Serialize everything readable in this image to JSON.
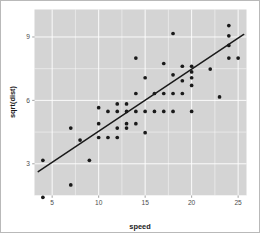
{
  "figure": {
    "background_color": "#ffffff",
    "border_color": "#b9b9b9",
    "panel_color": "#d4d4d4",
    "gridline_color": "#ffffff",
    "point_color": "#1a1a1a",
    "line_color": "#1a1a1a"
  },
  "chart_data": {
    "type": "scatter",
    "title": "",
    "subtitle": "",
    "xlabel": "speed",
    "ylabel": "sqrt(dist)",
    "xlim": [
      3.1,
      25.9
    ],
    "ylim": [
      1.5,
      10.3
    ],
    "xticks": [
      5,
      10,
      15,
      20,
      25
    ],
    "xtick_labels": [
      "5",
      "10",
      "15",
      "20",
      "25"
    ],
    "yticks": [
      3,
      6,
      9
    ],
    "ytick_labels": [
      "3",
      "6",
      "9"
    ],
    "grid": true,
    "grid_major_x": [
      5,
      10,
      15,
      20,
      25
    ],
    "grid_major_y": [
      3,
      6,
      9
    ],
    "grid_minor_x": [
      7.5,
      12.5,
      17.5,
      22.5
    ],
    "grid_minor_y": [
      1.5,
      4.5,
      7.5
    ],
    "legend": "none",
    "x": [
      4,
      4,
      7,
      7,
      8,
      9,
      10,
      10,
      10,
      11,
      11,
      12,
      12,
      12,
      12,
      13,
      13,
      13,
      13,
      14,
      14,
      14,
      14,
      15,
      15,
      15,
      16,
      16,
      17,
      17,
      17,
      18,
      18,
      18,
      18,
      19,
      19,
      19,
      20,
      20,
      20,
      20,
      20,
      22,
      23,
      24,
      24,
      24,
      24,
      25
    ],
    "y": [
      1.414,
      3.162,
      2.0,
      4.69,
      4.123,
      3.162,
      4.243,
      4.899,
      5.657,
      4.243,
      5.477,
      4.243,
      4.69,
      5.477,
      5.831,
      4.69,
      4.899,
      5.477,
      5.831,
      6.325,
      4.899,
      5.477,
      8.0,
      4.472,
      5.477,
      7.071,
      5.477,
      6.325,
      5.477,
      6.325,
      7.746,
      5.477,
      6.325,
      7.211,
      9.165,
      6.325,
      6.928,
      7.616,
      5.477,
      6.708,
      7.071,
      7.348,
      7.616,
      7.483,
      6.164,
      8.0,
      8.602,
      9.539,
      9.055,
      8.0
    ],
    "n_points": 50,
    "fit": {
      "type": "linear",
      "x_start": 3.5,
      "y_start": 2.63,
      "x_end": 25.6,
      "y_end": 9.12
    }
  }
}
